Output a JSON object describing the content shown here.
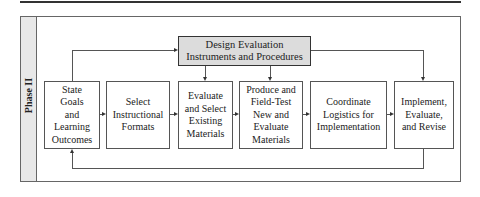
{
  "diagram": {
    "phase_label": "Phase II",
    "top_box": {
      "label": "Design Evaluation\nInstruments and Procedures"
    },
    "steps": [
      {
        "label": "State\nGoals\nand\nLearning\nOutcomes"
      },
      {
        "label": "Select\nInstructional\nFormats"
      },
      {
        "label": "Evaluate\nand Select\nExisting\nMaterials"
      },
      {
        "label": "Produce and\nField-Test\nNew and\nEvaluate\nMaterials"
      },
      {
        "label": "Coordinate\nLogistics for\nImplementation"
      },
      {
        "label": "Implement,\nEvaluate,\nand Revise"
      }
    ],
    "colors": {
      "top_box_fill": "#dcdcdc",
      "sidebar_fill": "#e8e8e8",
      "line": "#555555"
    }
  }
}
